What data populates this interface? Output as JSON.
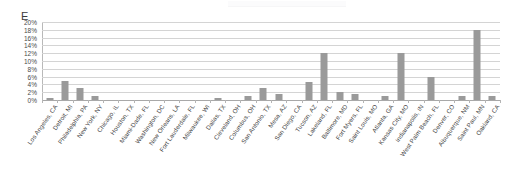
{
  "chart_letter": "E",
  "axis": {
    "y_ticks": [
      "0%",
      "2%",
      "4%",
      "6%",
      "8%",
      "10%",
      "12%",
      "14%",
      "16%",
      "18%",
      "20%"
    ],
    "y_min": 0,
    "y_max": 20
  },
  "chart_data": {
    "type": "bar",
    "title": "E",
    "xlabel": "",
    "ylabel": "",
    "ylim": [
      0,
      20
    ],
    "y_tick_step": 2,
    "y_tick_format": "percent",
    "grid": true,
    "legend": false,
    "bar_color": "#9a9a9a",
    "categories": [
      "Los Angeles, CA",
      "Detroit, MI",
      "Philadelphia, PA",
      "New York, NY",
      "Chicago, IL",
      "Houston, TX",
      "Miami-Dade, FL",
      "Washington, DC",
      "New Orleans, LA",
      "Fort Lauderdale, FL",
      "Milwaukee, WI",
      "Dallas, TX",
      "Cleveland, OH",
      "Columbus, OH",
      "San Antonio, TX",
      "Mesa, AZ",
      "San Diego, CA",
      "Tucson, AZ",
      "Lakeland, FL",
      "Baltimore, MD",
      "Fort Myers, FL",
      "Saint Louis, MO",
      "Atlanta, GA",
      "Kansas City, MO",
      "Indianapolis, IN",
      "West Palm Beach, FL",
      "Denver, CO",
      "Albuquerque, NM",
      "Saint Paul, MN",
      "Oakland, CA"
    ],
    "values": [
      0.5,
      5.0,
      3.0,
      1.0,
      0.0,
      0.0,
      0.0,
      0.0,
      0.0,
      0.0,
      0.0,
      0.5,
      0.0,
      1.0,
      3.0,
      1.5,
      0.0,
      4.5,
      12.0,
      2.0,
      1.5,
      0.0,
      1.0,
      12.0,
      0.0,
      6.0,
      0.0,
      1.0,
      18.0,
      1.0
    ]
  }
}
